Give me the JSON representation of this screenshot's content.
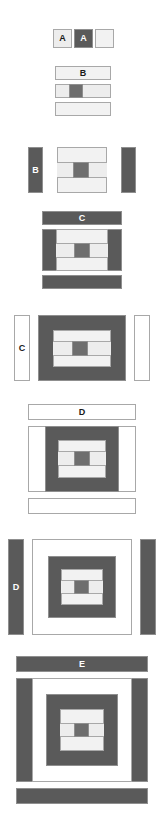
{
  "diagram": {
    "palette": {
      "background": "#ffffff",
      "dark_fill": "#5a5a5a",
      "light_fill": "#ededed",
      "pale_fill": "#f2f2f2",
      "white_fill": "#ffffff",
      "mid_fill": "#e4e4e4",
      "core_fill": "#6e6e6e",
      "border": "#a8a8a8",
      "border_dark": "#8f8f8f",
      "label_on_dark": "#ffffff",
      "label_on_light": "#1a1a1a"
    },
    "levels": [
      {
        "id": "level-a",
        "label": "A",
        "variants": [
          {
            "name": "a-light-labeled",
            "label": "A",
            "fill": "light"
          },
          {
            "name": "a-dark-labeled",
            "label": "A",
            "fill": "dark"
          },
          {
            "name": "a-light-empty",
            "label": "",
            "fill": "pale"
          }
        ]
      },
      {
        "id": "level-b",
        "label": "B",
        "rows": [
          {
            "name": "b-top-bar",
            "label": "B",
            "fill": "light"
          },
          {
            "name": "b-middle-row",
            "label": "",
            "fill": "light"
          },
          {
            "name": "b-bottom-bar",
            "label": "",
            "fill": "light"
          }
        ],
        "sides": {
          "name": "b-side-bars",
          "label": "B",
          "fill": "dark"
        }
      },
      {
        "id": "level-c",
        "label": "C",
        "rows": [
          {
            "name": "c-top-bar",
            "label": "C",
            "fill": "dark"
          },
          {
            "name": "c-middle-row",
            "label": "",
            "fill": "dark"
          },
          {
            "name": "c-bottom-bar",
            "label": "",
            "fill": "dark"
          }
        ],
        "sides": {
          "name": "c-side-bars",
          "label": "C",
          "fill": "white"
        }
      },
      {
        "id": "level-d",
        "label": "D",
        "rows": [
          {
            "name": "d-top-bar",
            "label": "D",
            "fill": "white"
          },
          {
            "name": "d-middle-row",
            "label": "",
            "fill": "white"
          },
          {
            "name": "d-bottom-bar",
            "label": "",
            "fill": "white"
          }
        ],
        "sides": {
          "name": "d-side-bars",
          "label": "D",
          "fill": "dark"
        }
      },
      {
        "id": "level-e",
        "label": "E",
        "rows": [
          {
            "name": "e-top-bar",
            "label": "E",
            "fill": "dark"
          },
          {
            "name": "e-middle-row",
            "label": "",
            "fill": "dark"
          },
          {
            "name": "e-bottom-bar",
            "label": "",
            "fill": "dark"
          }
        ]
      }
    ]
  }
}
